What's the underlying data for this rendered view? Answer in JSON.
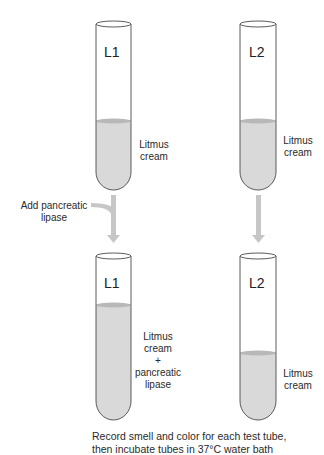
{
  "colors": {
    "liquid": "#d9d9d9",
    "meniscus": "#b8b8b8",
    "tube_outline": "#4a4a4a",
    "arrow": "#c6c6c6",
    "text": "#2a2a2a"
  },
  "before": {
    "tubes": [
      {
        "name": "L1",
        "contents": "Litmus cream",
        "contents_lines": [
          "Litmus",
          "cream"
        ],
        "fill_top_y": 121
      },
      {
        "name": "L2",
        "contents": "Litmus cream",
        "contents_lines": [
          "Litmus",
          "cream"
        ],
        "fill_top_y": 121
      }
    ]
  },
  "step": {
    "left_arrow_label": "Add pancreatic lipase",
    "left_arrow_label_lines": [
      "Add pancreatic",
      "lipase"
    ]
  },
  "after": {
    "tubes": [
      {
        "name": "L1",
        "contents": "Litmus cream + pancreatic lipase",
        "contents_lines": [
          "Litmus",
          "cream",
          "+",
          "pancreatic",
          "lipase"
        ],
        "fill_top_y": 305
      },
      {
        "name": "L2",
        "contents": "Litmus cream",
        "contents_lines": [
          "Litmus",
          "cream"
        ],
        "fill_top_y": 353
      }
    ]
  },
  "caption": {
    "line1": "Record smell and color for each test tube,",
    "line2": "then incubate tubes in 37°C water bath"
  }
}
